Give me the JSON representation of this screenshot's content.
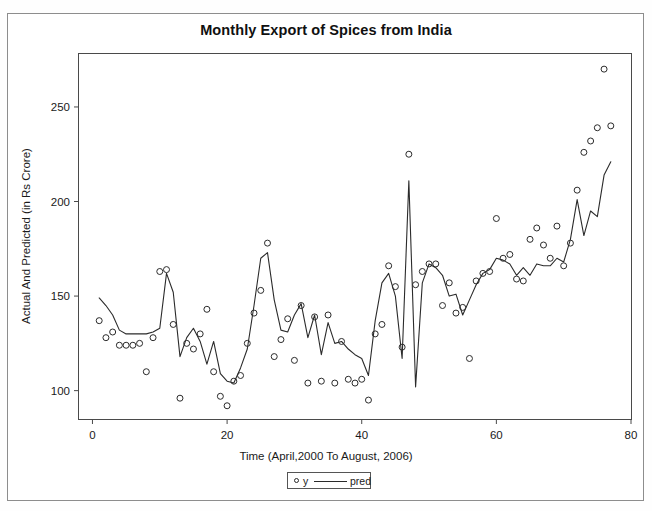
{
  "figure": {
    "title": "Monthly Export of Spices from India",
    "outer_border_color": "#8d8d8d",
    "background": "#ffffff"
  },
  "legend": {
    "y_label": "y",
    "pred_label": "pred",
    "position": "below-axis-center"
  },
  "chart_data": {
    "type": "scatter",
    "title": "Monthly Export of Spices from India",
    "xlabel": "Time (April,2000 To August, 2006)",
    "ylabel": "Actual And Predicted (in Rs Crore)",
    "xlim": [
      -2,
      80
    ],
    "ylim": [
      85,
      278
    ],
    "xticks": [
      0,
      20,
      40,
      60,
      80
    ],
    "yticks": [
      100,
      150,
      200,
      250
    ],
    "grid": false,
    "legend_position": "bottom-center",
    "series": [
      {
        "name": "y",
        "marker": "open-circle",
        "x": [
          1,
          2,
          3,
          4,
          5,
          6,
          7,
          8,
          9,
          10,
          11,
          12,
          13,
          14,
          15,
          16,
          17,
          18,
          19,
          20,
          21,
          22,
          23,
          24,
          25,
          26,
          27,
          28,
          29,
          30,
          31,
          32,
          33,
          34,
          35,
          36,
          37,
          38,
          39,
          40,
          41,
          42,
          43,
          44,
          45,
          46,
          47,
          48,
          49,
          50,
          51,
          52,
          53,
          54,
          55,
          56,
          57,
          58,
          59,
          60,
          61,
          62,
          63,
          64,
          65,
          66,
          67,
          68,
          69,
          70,
          71,
          72,
          73,
          74,
          75,
          76,
          77
        ],
        "values": [
          137,
          128,
          131,
          124,
          124,
          124,
          125,
          110,
          128,
          163,
          164,
          135,
          96,
          125,
          122,
          130,
          143,
          110,
          97,
          92,
          105,
          108,
          125,
          141,
          153,
          178,
          118,
          127,
          138,
          116,
          145,
          104,
          139,
          105,
          140,
          104,
          126,
          106,
          104,
          106,
          95,
          130,
          135,
          166,
          155,
          123,
          225,
          156,
          163,
          167,
          167,
          145,
          157,
          141,
          144,
          117,
          158,
          162,
          163,
          191,
          170,
          172,
          159,
          158,
          180,
          186,
          177,
          170,
          187,
          166,
          178,
          206,
          226,
          232,
          239,
          270,
          240
        ]
      },
      {
        "name": "pred",
        "marker": "line",
        "x": [
          1,
          2,
          3,
          4,
          5,
          6,
          7,
          8,
          9,
          10,
          11,
          12,
          13,
          14,
          15,
          16,
          17,
          18,
          19,
          20,
          21,
          22,
          23,
          24,
          25,
          26,
          27,
          28,
          29,
          30,
          31,
          32,
          33,
          34,
          35,
          36,
          37,
          38,
          39,
          40,
          41,
          42,
          43,
          44,
          45,
          46,
          47,
          48,
          49,
          50,
          51,
          52,
          53,
          54,
          55,
          56,
          57,
          58,
          59,
          60,
          61,
          62,
          63,
          64,
          65,
          66,
          67,
          68,
          69,
          70,
          71,
          72,
          73,
          74,
          75,
          76,
          77
        ],
        "values": [
          149,
          145,
          140,
          132,
          130,
          130,
          130,
          130,
          131,
          133,
          162,
          152,
          118,
          128,
          133,
          126,
          114,
          126,
          109,
          105,
          104,
          112,
          122,
          145,
          170,
          173,
          148,
          132,
          131,
          140,
          146,
          128,
          140,
          119,
          136,
          125,
          126,
          122,
          119,
          117,
          108,
          137,
          157,
          162,
          150,
          117,
          211,
          102,
          157,
          167,
          165,
          161,
          150,
          151,
          140,
          148,
          156,
          162,
          164,
          170,
          169,
          167,
          161,
          165,
          161,
          167,
          166,
          166,
          170,
          168,
          180,
          201,
          182,
          195,
          192,
          214,
          221
        ]
      }
    ]
  }
}
